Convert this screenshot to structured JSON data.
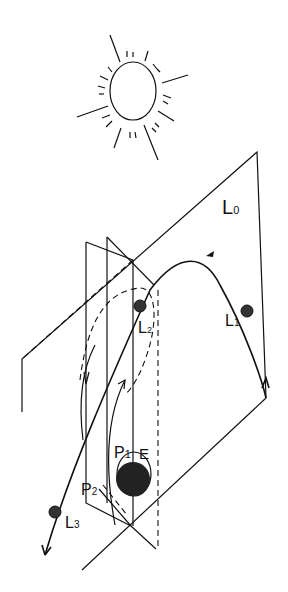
{
  "diagram": {
    "type": "lagrange-points-sun-earth-orbit-planes",
    "sun": {
      "label": ""
    },
    "labels": {
      "L0": {
        "main": "L",
        "sub": "0"
      },
      "L1": {
        "main": "L",
        "sub": "1"
      },
      "L2": {
        "main": "L",
        "sub": "2"
      },
      "L3": {
        "main": "L",
        "sub": "3"
      },
      "P1": {
        "main": "P",
        "sub": "1"
      },
      "P2": {
        "main": "P",
        "sub": "2"
      },
      "E": "E"
    }
  }
}
